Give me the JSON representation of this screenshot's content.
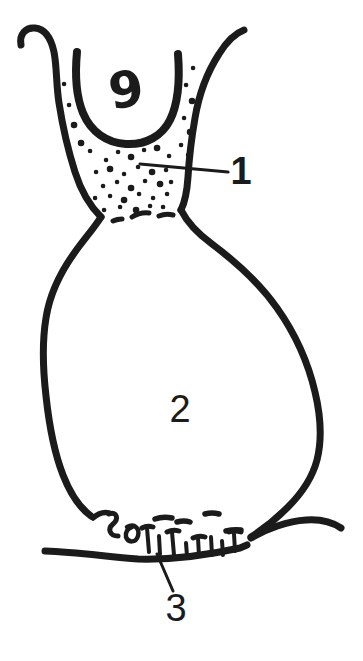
{
  "diagram": {
    "background_color": "#ffffff",
    "ink_color": "#1b1b1b",
    "figure_number": "9",
    "callout_1": "1",
    "callout_2": "2",
    "callout_3": "3"
  }
}
